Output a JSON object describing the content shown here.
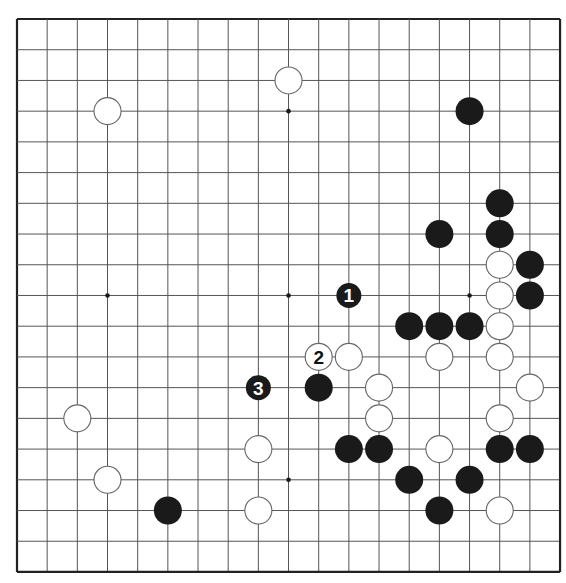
{
  "board": {
    "size": 19,
    "origin_x": 17,
    "origin_y": 19,
    "spacing_x": 30.17,
    "spacing_y": 30.72,
    "stone_radius": 14,
    "colors": {
      "background": "#ffffff",
      "grid_line": "#555555",
      "border_line": "#222222",
      "black_stone": "#1a1a1a",
      "white_stone_fill": "#ffffff",
      "white_stone_stroke": "#666666",
      "star_point": "#1a1a1a"
    },
    "star_points": [
      [
        3,
        3
      ],
      [
        9,
        3
      ],
      [
        15,
        3
      ],
      [
        3,
        9
      ],
      [
        9,
        9
      ],
      [
        15,
        9
      ],
      [
        3,
        15
      ],
      [
        9,
        15
      ],
      [
        15,
        15
      ]
    ]
  },
  "stones": {
    "white": [
      [
        9,
        2
      ],
      [
        3,
        3
      ],
      [
        16,
        8
      ],
      [
        16,
        9
      ],
      [
        16,
        10
      ],
      [
        11,
        11
      ],
      [
        14,
        11
      ],
      [
        16,
        11
      ],
      [
        12,
        12
      ],
      [
        17,
        12
      ],
      [
        2,
        13
      ],
      [
        12,
        13
      ],
      [
        16,
        13
      ],
      [
        8,
        14
      ],
      [
        14,
        14
      ],
      [
        3,
        15
      ],
      [
        8,
        16
      ],
      [
        16,
        16
      ]
    ],
    "black": [
      [
        15,
        3
      ],
      [
        16,
        6
      ],
      [
        14,
        7
      ],
      [
        16,
        7
      ],
      [
        17,
        8
      ],
      [
        17,
        9
      ],
      [
        13,
        10
      ],
      [
        14,
        10
      ],
      [
        15,
        10
      ],
      [
        10,
        12
      ],
      [
        11,
        14
      ],
      [
        12,
        14
      ],
      [
        16,
        14
      ],
      [
        17,
        14
      ],
      [
        13,
        15
      ],
      [
        15,
        15
      ],
      [
        14,
        16
      ],
      [
        5,
        16
      ]
    ]
  },
  "numbered_moves": [
    {
      "number": "1",
      "color": "black",
      "col": 11,
      "row": 9
    },
    {
      "number": "2",
      "color": "white",
      "col": 10,
      "row": 11
    },
    {
      "number": "3",
      "color": "black",
      "col": 8,
      "row": 12
    }
  ]
}
